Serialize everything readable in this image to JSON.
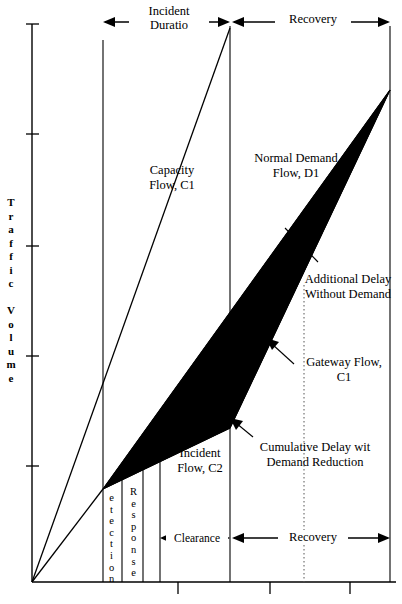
{
  "figure": {
    "type": "incident-delay-diagram",
    "axes": {
      "y_title": "Traffic Volume",
      "y_title_letters": [
        "T",
        "r",
        "a",
        "f",
        "f",
        "i",
        "c",
        "",
        "V",
        "o",
        "l",
        "u",
        "m",
        "e"
      ],
      "x_title": "",
      "y_ticks": [
        24,
        134,
        246,
        356,
        466
      ],
      "x_ticks": [
        178,
        270,
        350
      ],
      "origin": {
        "x": 32,
        "y": 582
      }
    },
    "top_spans": [
      {
        "name": "incident-duration",
        "label": "Incident\nDuratio",
        "from": 103,
        "to": 230
      },
      {
        "name": "recovery",
        "label": "Recovery",
        "from": 230,
        "to": 390
      }
    ],
    "bottom_spans": [
      {
        "name": "clearance",
        "label": "Clearance",
        "from": 160,
        "to": 230
      },
      {
        "name": "recovery-bottom",
        "label": "Recovery",
        "from": 232,
        "to": 390
      }
    ],
    "vertical_labels": [
      {
        "name": "detection",
        "label": "etection",
        "x": 107
      },
      {
        "name": "response",
        "label": "Response",
        "x": 131
      }
    ],
    "inner_labels": [
      {
        "name": "capacity-flow",
        "label": "Capacity\nFlow, C1",
        "x": 139,
        "y": 163
      },
      {
        "name": "normal-demand-flow",
        "label": "Normal Demand\nFlow, D1",
        "x": 243,
        "y": 151
      },
      {
        "name": "additional-delay",
        "label": "Additional Delay\nWithout\nDemand",
        "x": 297,
        "y": 272
      },
      {
        "name": "gateway-flow",
        "label": "Gateway Flow,\nC1",
        "x": 298,
        "y": 355
      },
      {
        "name": "cumulative-delay",
        "label": "Cumulative Delay wit\nDemand Reduction",
        "x": 240,
        "y": 440
      },
      {
        "name": "incident-flow",
        "label": "Incident\nFlow, C2",
        "x": 171,
        "y": 446
      }
    ],
    "colors": {
      "ink": "#000000",
      "background": "#ffffff",
      "shaded_region": "#000000",
      "dotted_guide": "#555555"
    },
    "curves": [
      {
        "name": "capacity-flow-c1",
        "points": "32,582 230,28"
      },
      {
        "name": "incident-flow-c2",
        "points": "32,582 103,489"
      },
      {
        "name": "demand-d1-upper",
        "points": "103,489 390,90"
      },
      {
        "name": "gateway-lower",
        "points": "103,489 230,428 390,90"
      }
    ]
  }
}
